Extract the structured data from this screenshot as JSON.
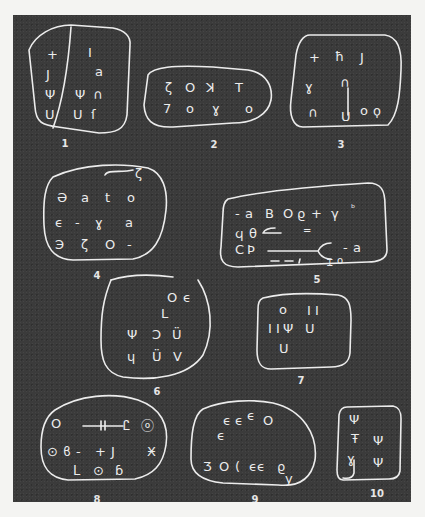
{
  "figure": {
    "colors": {
      "background": "#3b3b3b",
      "page": "#f4f4f2",
      "lines": "#ececec"
    },
    "tablets": [
      {
        "label": "1",
        "signs": [
          "+",
          "J",
          "Ψ",
          "U",
          "I",
          "a",
          "Ψ",
          "∩",
          "U",
          "ſ"
        ]
      },
      {
        "label": "2",
        "signs": [
          "ζ",
          "O",
          "ꓘ",
          "T",
          "7",
          "O",
          "ɣ",
          "o"
        ]
      },
      {
        "label": "3",
        "signs": [
          "+",
          "ħ",
          "J",
          "ɣ",
          "∩",
          "|",
          "∩",
          "U",
          "o",
          "ϙ"
        ]
      },
      {
        "label": "4",
        "signs": [
          "∼ʻ",
          "Ә",
          "a",
          "t",
          "o",
          "ϵ",
          "-",
          "ɣ",
          "a",
          "Э",
          "ζ",
          "O",
          "-"
        ]
      },
      {
        "label": "5",
        "signs": [
          "-",
          "a",
          "B",
          "O",
          "ϱ",
          "+",
          "γ",
          "ᵇ",
          "ϥ",
          "θ",
          "⟵",
          "=",
          "C",
          "Ϸ",
          "⟵",
          "ϵ",
          "-",
          "a",
          "- - ,",
          "Ꮖ",
          "o"
        ]
      },
      {
        "label": "6",
        "signs": [
          "O",
          "ϵ",
          "L",
          "Ψ",
          "Ͻ",
          "Ü",
          "ɥ",
          "Ü",
          "V"
        ]
      },
      {
        "label": "7",
        "signs": [
          "O",
          "I I",
          "I I",
          "Ψ",
          "U",
          "U"
        ]
      },
      {
        "label": "8",
        "signs": [
          "O",
          "⊣⊢",
          "Ꮭ",
          "ⓞ",
          "⊙",
          "ϐ",
          "-",
          "+",
          "J",
          "Ӿ",
          "ᒪ",
          "⊙",
          "ɓ"
        ]
      },
      {
        "label": "9",
        "signs": [
          "ϵϵ",
          "ϵ",
          "O",
          "ϵ",
          "Ӡ",
          "O",
          "(",
          "ϵϵ",
          "ϱ",
          "y"
        ]
      },
      {
        "label": "10",
        "signs": [
          "Ψ",
          "Ŧ",
          "Ψ",
          "ɣ",
          "Ψ"
        ]
      }
    ]
  }
}
